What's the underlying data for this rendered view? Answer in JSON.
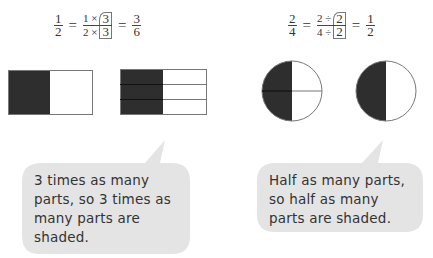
{
  "left": {
    "equation": {
      "lhs": {
        "num": "1",
        "den": "2"
      },
      "middle": {
        "num_left": "1 ×",
        "den_left": "2 ×",
        "box_num": "3",
        "box_den": "3"
      },
      "rhs": {
        "num": "3",
        "den": "6"
      },
      "equals": "="
    },
    "shapes": [
      {
        "type": "rectangle",
        "parts": 2,
        "shaded": 1,
        "label": "1/2 rectangle"
      },
      {
        "type": "rectangle",
        "parts": 6,
        "shaded": 3,
        "label": "3/6 rectangle"
      }
    ],
    "bubble": {
      "lines": [
        "3 times as many",
        "parts, so 3 times as",
        "many parts are",
        "shaded."
      ]
    }
  },
  "right": {
    "equation": {
      "lhs": {
        "num": "2",
        "den": "4"
      },
      "middle": {
        "num_left": "2 ÷",
        "den_left": "4 ÷",
        "box_num": "2",
        "box_den": "2"
      },
      "rhs": {
        "num": "1",
        "den": "2"
      },
      "equals": "="
    },
    "shapes": [
      {
        "type": "circle",
        "parts": 4,
        "shaded": 2,
        "label": "2/4 circle"
      },
      {
        "type": "circle",
        "parts": 2,
        "shaded": 1,
        "label": "1/2 circle"
      }
    ],
    "bubble": {
      "lines": [
        "Half as many parts,",
        "so half as many",
        "parts are shaded."
      ]
    }
  },
  "colors": {
    "shade": "#2e2e2e",
    "outline": "#777777",
    "bubble_fill": "#e4e4e4",
    "text": "#333333"
  }
}
